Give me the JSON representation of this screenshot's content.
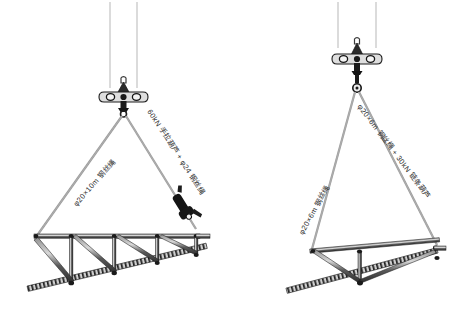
{
  "figure": {
    "type": "engineering-rigging-diagram",
    "background_color": "#ffffff",
    "line_color": "#3a3a3a",
    "accent_dark": "#151515",
    "panels": [
      {
        "id": "left",
        "name": "two-point-sling-with-chain-hoist",
        "labels": {
          "left_sling": "φ20×10m 钢丝绳",
          "right_sling": "60kN 手拉葫芦 + φ24 钢丝绳"
        }
      },
      {
        "id": "right",
        "name": "two-point-sling-with-chain-block",
        "labels": {
          "left_sling": "φ20×6m 钢丝绳",
          "right_sling": "φ20×6m 钢丝绳 + 30kN 链条葫芦"
        }
      }
    ]
  },
  "labels": {
    "left_panel_left_rope": "φ20×10m 钢丝绳",
    "left_panel_right_rope": "60kN 手拉葫芦 + φ24 钢丝绳",
    "right_panel_left_rope": "φ20×6m 钢丝绳",
    "right_panel_right_rope": "φ20×6m 钢丝绳 + 30kN 链条葫芦"
  },
  "label_positions": {
    "left_panel_left_rope": {
      "x": 74,
      "y": 199,
      "rotate": -49
    },
    "left_panel_right_rope": {
      "x": 150,
      "y": 104,
      "rotate": 57
    },
    "right_panel_left_rope": {
      "x": 300,
      "y": 228,
      "rotate": -61
    },
    "right_panel_right_rope": {
      "x": 360,
      "y": 99,
      "rotate": 53
    }
  },
  "icons": {
    "spreader_beam": "spreader-beam-icon",
    "shackle": "shackle-icon",
    "chain_hoist": "chain-hoist-icon",
    "crane_cable": "crane-cable-icon",
    "truss": "truss-icon"
  }
}
